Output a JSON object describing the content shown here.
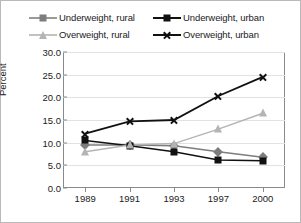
{
  "chart_data": {
    "type": "line",
    "title": "",
    "xlabel": "",
    "ylabel": "Percent",
    "categories": [
      "1989",
      "1991",
      "1993",
      "1997",
      "2000"
    ],
    "ylim": [
      0,
      30
    ],
    "ytick_labels": [
      "0.0",
      "5.0",
      "10.0",
      "15.0",
      "20.0",
      "25.0",
      "30.0"
    ],
    "ytick_values": [
      0,
      5,
      10,
      15,
      20,
      25,
      30
    ],
    "grid": true,
    "legend_position": "top",
    "series": [
      {
        "name": "Underweight, rural",
        "marker": "diamond",
        "color": "#7d7d7d",
        "values": [
          9.5,
          9.5,
          9.3,
          8.0,
          6.8
        ]
      },
      {
        "name": "Underweight, urban",
        "marker": "square",
        "color": "#111111",
        "values": [
          10.5,
          9.3,
          8.0,
          6.2,
          6.0
        ]
      },
      {
        "name": "Overweight, rural",
        "marker": "triangle",
        "color": "#b4b4b4",
        "values": [
          8.0,
          9.5,
          9.8,
          13.0,
          16.5
        ]
      },
      {
        "name": "Overweight, urban",
        "marker": "x",
        "color": "#111111",
        "values": [
          12.0,
          14.7,
          15.0,
          20.3,
          24.5
        ]
      }
    ]
  },
  "legend": {
    "items": [
      {
        "label": "Underweight, rural",
        "marker": "diamond-marker"
      },
      {
        "label": "Underweight, urban",
        "marker": "square-marker"
      },
      {
        "label": "Overweight, rural",
        "marker": "triangle-marker"
      },
      {
        "label": "Overweight, urban",
        "marker": "x-marker"
      }
    ]
  }
}
